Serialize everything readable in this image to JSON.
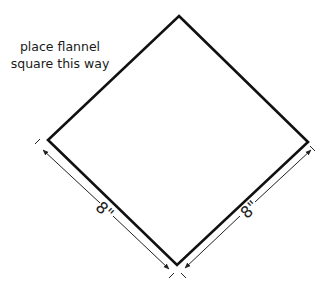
{
  "diagram": {
    "instruction_line1": "place flannel",
    "instruction_line2": "square this way",
    "shape": "square rotated 45 degrees (diamond)",
    "dimensions": [
      {
        "side": "bottom-left",
        "label": "8\""
      },
      {
        "side": "bottom-right",
        "label": "8\""
      }
    ],
    "colors": {
      "stroke": "#111111",
      "dimension": "#222222",
      "background": "#ffffff"
    }
  }
}
